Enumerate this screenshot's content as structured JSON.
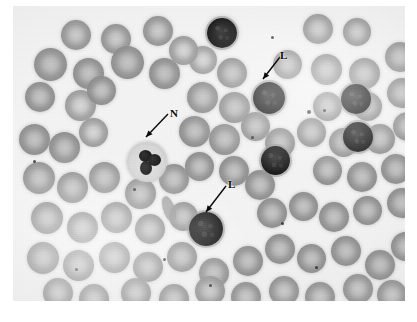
{
  "image": {
    "kind": "micrograph",
    "subject": "peripheral blood smear",
    "stain": "Wright-Giemsa (grayscale reproduction)",
    "background_color": "#ffffff",
    "plate_color": "#f4f4f4",
    "ink_color": "#0a0a0a"
  },
  "annotations": [
    {
      "id": "label-n",
      "text": "N",
      "meaning": "neutrophil",
      "label_x": 170,
      "label_y": 108,
      "arrow_x1": 168,
      "arrow_y1": 114,
      "arrow_x2": 146,
      "arrow_y2": 137
    },
    {
      "id": "label-l-top",
      "text": "L",
      "meaning": "lymphocyte",
      "label_x": 280,
      "label_y": 50,
      "arrow_x1": 280,
      "arrow_y1": 57,
      "arrow_x2": 263,
      "arrow_y2": 79
    },
    {
      "id": "label-l-bottom",
      "text": "L",
      "meaning": "lymphocyte",
      "label_x": 228,
      "label_y": 179,
      "arrow_x1": 226,
      "arrow_y1": 186,
      "arrow_x2": 206,
      "arrow_y2": 212
    }
  ],
  "cells": {
    "erythrocytes": [
      {
        "x": 48,
        "y": 14,
        "d": 30,
        "tone": "pale",
        "blur": true
      },
      {
        "x": 88,
        "y": 18,
        "d": 30,
        "tone": "pale",
        "blur": true
      },
      {
        "x": 130,
        "y": 10,
        "d": 30,
        "tone": "pale",
        "blur": true
      },
      {
        "x": 176,
        "y": 40,
        "d": 28,
        "tone": "pale",
        "blur": false
      },
      {
        "x": 204,
        "y": 52,
        "d": 30,
        "tone": "norm",
        "blur": false
      },
      {
        "x": 290,
        "y": 8,
        "d": 30,
        "tone": "pale",
        "blur": true
      },
      {
        "x": 330,
        "y": 12,
        "d": 28,
        "tone": "pale",
        "blur": true
      },
      {
        "x": 21,
        "y": 42,
        "d": 33,
        "tone": "norm",
        "blur": false
      },
      {
        "x": 60,
        "y": 52,
        "d": 31,
        "tone": "norm",
        "blur": false
      },
      {
        "x": 98,
        "y": 40,
        "d": 33,
        "tone": "norm",
        "blur": false
      },
      {
        "x": 136,
        "y": 52,
        "d": 31,
        "tone": "norm",
        "blur": false
      },
      {
        "x": 156,
        "y": 30,
        "d": 29,
        "tone": "pale",
        "blur": false
      },
      {
        "x": 260,
        "y": 44,
        "d": 29,
        "tone": "norm",
        "blur": false
      },
      {
        "x": 298,
        "y": 48,
        "d": 31,
        "tone": "norm",
        "blur": false
      },
      {
        "x": 336,
        "y": 52,
        "d": 31,
        "tone": "norm",
        "blur": false
      },
      {
        "x": 372,
        "y": 36,
        "d": 30,
        "tone": "norm",
        "blur": false
      },
      {
        "x": 12,
        "y": 76,
        "d": 30,
        "tone": "norm",
        "blur": false
      },
      {
        "x": 52,
        "y": 84,
        "d": 31,
        "tone": "pale",
        "blur": false
      },
      {
        "x": 74,
        "y": 70,
        "d": 29,
        "tone": "norm",
        "blur": false
      },
      {
        "x": 174,
        "y": 76,
        "d": 31,
        "tone": "norm",
        "blur": false
      },
      {
        "x": 206,
        "y": 86,
        "d": 31,
        "tone": "norm",
        "blur": false
      },
      {
        "x": 300,
        "y": 86,
        "d": 29,
        "tone": "norm",
        "blur": false
      },
      {
        "x": 340,
        "y": 86,
        "d": 29,
        "tone": "norm",
        "blur": false
      },
      {
        "x": 374,
        "y": 72,
        "d": 30,
        "tone": "norm",
        "blur": false
      },
      {
        "x": 166,
        "y": 110,
        "d": 31,
        "tone": "norm",
        "blur": false
      },
      {
        "x": 196,
        "y": 118,
        "d": 31,
        "tone": "norm",
        "blur": false
      },
      {
        "x": 228,
        "y": 106,
        "d": 29,
        "tone": "norm",
        "blur": false
      },
      {
        "x": 252,
        "y": 122,
        "d": 30,
        "tone": "norm",
        "blur": false
      },
      {
        "x": 284,
        "y": 112,
        "d": 29,
        "tone": "norm",
        "blur": false
      },
      {
        "x": 316,
        "y": 122,
        "d": 29,
        "tone": "norm",
        "blur": false
      },
      {
        "x": 352,
        "y": 118,
        "d": 30,
        "tone": "norm",
        "blur": false
      },
      {
        "x": 380,
        "y": 106,
        "d": 29,
        "tone": "norm",
        "blur": false
      },
      {
        "x": 6,
        "y": 118,
        "d": 31,
        "tone": "norm",
        "blur": false
      },
      {
        "x": 36,
        "y": 126,
        "d": 31,
        "tone": "norm",
        "blur": false
      },
      {
        "x": 66,
        "y": 112,
        "d": 29,
        "tone": "pale",
        "blur": false
      },
      {
        "x": 10,
        "y": 156,
        "d": 32,
        "tone": "norm",
        "blur": false
      },
      {
        "x": 44,
        "y": 166,
        "d": 31,
        "tone": "norm",
        "blur": false
      },
      {
        "x": 76,
        "y": 156,
        "d": 31,
        "tone": "norm",
        "blur": false
      },
      {
        "x": 112,
        "y": 172,
        "d": 31,
        "tone": "norm",
        "blur": false
      },
      {
        "x": 146,
        "y": 158,
        "d": 30,
        "tone": "norm",
        "blur": false
      },
      {
        "x": 172,
        "y": 146,
        "d": 29,
        "tone": "norm",
        "blur": false
      },
      {
        "x": 206,
        "y": 150,
        "d": 30,
        "tone": "norm",
        "blur": false
      },
      {
        "x": 232,
        "y": 164,
        "d": 30,
        "tone": "norm",
        "blur": false
      },
      {
        "x": 300,
        "y": 150,
        "d": 29,
        "tone": "norm",
        "blur": false
      },
      {
        "x": 334,
        "y": 156,
        "d": 30,
        "tone": "norm",
        "blur": false
      },
      {
        "x": 368,
        "y": 148,
        "d": 30,
        "tone": "norm",
        "blur": false
      },
      {
        "x": 244,
        "y": 192,
        "d": 30,
        "tone": "norm",
        "blur": false
      },
      {
        "x": 276,
        "y": 186,
        "d": 29,
        "tone": "norm",
        "blur": false
      },
      {
        "x": 306,
        "y": 196,
        "d": 30,
        "tone": "norm",
        "blur": false
      },
      {
        "x": 340,
        "y": 190,
        "d": 29,
        "tone": "norm",
        "blur": false
      },
      {
        "x": 374,
        "y": 182,
        "d": 30,
        "tone": "norm",
        "blur": false
      },
      {
        "x": 18,
        "y": 196,
        "d": 32,
        "tone": "norm",
        "blur": false
      },
      {
        "x": 54,
        "y": 206,
        "d": 31,
        "tone": "norm",
        "blur": false
      },
      {
        "x": 88,
        "y": 196,
        "d": 31,
        "tone": "norm",
        "blur": false
      },
      {
        "x": 122,
        "y": 208,
        "d": 30,
        "tone": "norm",
        "blur": false
      },
      {
        "x": 156,
        "y": 196,
        "d": 29,
        "tone": "norm",
        "blur": false
      },
      {
        "x": 14,
        "y": 236,
        "d": 32,
        "tone": "norm",
        "blur": false
      },
      {
        "x": 50,
        "y": 244,
        "d": 31,
        "tone": "norm",
        "blur": false
      },
      {
        "x": 86,
        "y": 236,
        "d": 31,
        "tone": "norm",
        "blur": false
      },
      {
        "x": 120,
        "y": 246,
        "d": 30,
        "tone": "norm",
        "blur": false
      },
      {
        "x": 154,
        "y": 236,
        "d": 30,
        "tone": "norm",
        "blur": false
      },
      {
        "x": 186,
        "y": 252,
        "d": 30,
        "tone": "norm",
        "blur": false
      },
      {
        "x": 220,
        "y": 240,
        "d": 30,
        "tone": "norm",
        "blur": false
      },
      {
        "x": 252,
        "y": 228,
        "d": 30,
        "tone": "norm",
        "blur": false
      },
      {
        "x": 284,
        "y": 238,
        "d": 29,
        "tone": "norm",
        "blur": false
      },
      {
        "x": 318,
        "y": 230,
        "d": 30,
        "tone": "norm",
        "blur": false
      },
      {
        "x": 352,
        "y": 244,
        "d": 30,
        "tone": "norm",
        "blur": false
      },
      {
        "x": 378,
        "y": 226,
        "d": 29,
        "tone": "norm",
        "blur": false
      },
      {
        "x": 30,
        "y": 272,
        "d": 30,
        "tone": "pale",
        "blur": true
      },
      {
        "x": 66,
        "y": 278,
        "d": 30,
        "tone": "pale",
        "blur": true
      },
      {
        "x": 108,
        "y": 272,
        "d": 30,
        "tone": "norm",
        "blur": true
      },
      {
        "x": 146,
        "y": 278,
        "d": 30,
        "tone": "norm",
        "blur": true
      },
      {
        "x": 182,
        "y": 270,
        "d": 30,
        "tone": "norm",
        "blur": true
      },
      {
        "x": 218,
        "y": 276,
        "d": 30,
        "tone": "norm",
        "blur": true
      },
      {
        "x": 256,
        "y": 270,
        "d": 30,
        "tone": "norm",
        "blur": true
      },
      {
        "x": 292,
        "y": 276,
        "d": 30,
        "tone": "norm",
        "blur": true
      },
      {
        "x": 330,
        "y": 268,
        "d": 30,
        "tone": "norm",
        "blur": true
      },
      {
        "x": 364,
        "y": 274,
        "d": 30,
        "tone": "norm",
        "blur": true
      }
    ],
    "lymphocytes": [
      {
        "x": 194,
        "y": 12,
        "d": 30,
        "label": "unlabelled"
      },
      {
        "x": 240,
        "y": 76,
        "d": 32,
        "label": "L-top"
      },
      {
        "x": 328,
        "y": 78,
        "d": 30,
        "label": "unlabelled"
      },
      {
        "x": 330,
        "y": 116,
        "d": 30,
        "label": "unlabelled"
      },
      {
        "x": 248,
        "y": 140,
        "d": 29,
        "label": "unlabelled"
      },
      {
        "x": 176,
        "y": 206,
        "d": 34,
        "label": "L-bottom"
      }
    ],
    "neutrophils": [
      {
        "x": 114,
        "y": 136,
        "d": 40,
        "label": "N",
        "lobes": [
          {
            "x": 12,
            "y": 8,
            "w": 13,
            "h": 12
          },
          {
            "x": 21,
            "y": 12,
            "w": 13,
            "h": 12
          },
          {
            "x": 13,
            "y": 19,
            "w": 12,
            "h": 14
          }
        ]
      }
    ],
    "platelets": [
      {
        "x": 258,
        "y": 30,
        "d": 3
      },
      {
        "x": 294,
        "y": 104,
        "d": 4
      },
      {
        "x": 310,
        "y": 103,
        "d": 3
      },
      {
        "x": 120,
        "y": 182,
        "d": 3
      },
      {
        "x": 238,
        "y": 130,
        "d": 3
      },
      {
        "x": 196,
        "y": 278,
        "d": 3
      },
      {
        "x": 20,
        "y": 154,
        "d": 3
      },
      {
        "x": 268,
        "y": 216,
        "d": 3
      },
      {
        "x": 340,
        "y": 92,
        "d": 3
      },
      {
        "x": 62,
        "y": 262,
        "d": 3
      },
      {
        "x": 150,
        "y": 252,
        "d": 3
      },
      {
        "x": 302,
        "y": 260,
        "d": 3
      }
    ],
    "fragments": [
      {
        "x": 150,
        "y": 190,
        "w": 12,
        "h": 26,
        "rot": -22
      }
    ]
  }
}
